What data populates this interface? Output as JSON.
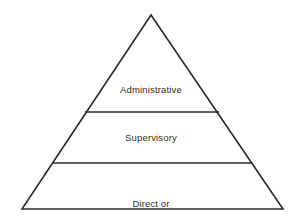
{
  "figure": {
    "name": "management-level-pyramid",
    "background_color": "#ffffff",
    "line_color": "#2b2b2b",
    "text_color": "#2c2c2c"
  },
  "pyramid": {
    "apex": {
      "x": 151,
      "y": 15
    },
    "base_left": {
      "x": 22,
      "y": 209
    },
    "base_right": {
      "x": 283,
      "y": 209
    },
    "dividers": [
      {
        "name": "divider-upper",
        "y": 112,
        "x_start": 85,
        "x_end": 219
      },
      {
        "name": "divider-lower",
        "y": 163,
        "x_start": 53,
        "x_end": 252
      }
    ],
    "tiers": [
      {
        "id": "administrative",
        "label": "Administrative",
        "lines": [
          "Administrative"
        ]
      },
      {
        "id": "supervisory",
        "label": "Supervisory",
        "lines": [
          "Supervisory"
        ]
      },
      {
        "id": "direct-face-to-face",
        "label": "Direct or Face-to-Face",
        "lines": [
          "Direct or",
          "Face-to-Face"
        ]
      }
    ]
  },
  "labels": {
    "administrative": "Administrative",
    "supervisory": "Supervisory",
    "direct_line1": "Direct or",
    "direct_line2": "Face-to-Face"
  }
}
